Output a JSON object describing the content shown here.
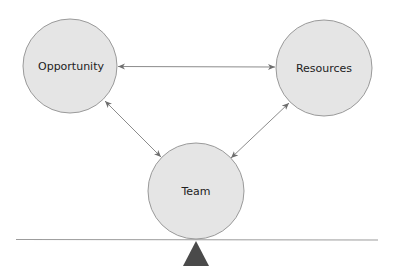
{
  "diagram": {
    "title": "",
    "nodes": [
      {
        "id": "opportunity",
        "label": "Opportunity",
        "cx": 70,
        "cy": 66,
        "r": 47
      },
      {
        "id": "resources",
        "label": "Resources",
        "cx": 324,
        "cy": 68,
        "r": 48
      },
      {
        "id": "team",
        "label": "Team",
        "cx": 196,
        "cy": 191,
        "r": 48
      }
    ],
    "edges": [
      {
        "from": "opportunity",
        "to": "resources",
        "type": "bidirectional-arrow"
      },
      {
        "from": "opportunity",
        "to": "team",
        "type": "bidirectional-arrow"
      },
      {
        "from": "resources",
        "to": "team",
        "type": "bidirectional-arrow"
      }
    ],
    "balance": {
      "beam": {
        "x1": 16,
        "y1": 239,
        "x2": 378,
        "y2": 240
      },
      "fulcrum": {
        "apex": [
          196,
          241
        ],
        "base_left": [
          183,
          266
        ],
        "base_right": [
          209,
          266
        ]
      }
    },
    "colors": {
      "node_fill": "#e5e5e5",
      "node_stroke": "#9a9a9a",
      "arrow": "#8c8c8c",
      "beam": "#9c9c9c",
      "fulcrum": "#4a4a4a",
      "text": "#222222"
    }
  }
}
